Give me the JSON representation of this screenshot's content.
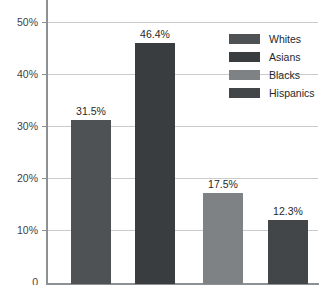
{
  "chart_data": {
    "type": "bar",
    "title": "",
    "subtitle": "",
    "xlabel": "",
    "ylabel": "",
    "categories": [
      "Whites",
      "Asians",
      "Blacks",
      "Hispanics"
    ],
    "values": [
      31.5,
      46.4,
      17.5,
      12.3
    ],
    "data_labels": [
      "31.5%",
      "46.4%",
      "17.5%",
      "12.3%"
    ],
    "ylim": [
      0,
      50
    ],
    "y_ticks": [
      50,
      40,
      30,
      20,
      10,
      0
    ],
    "y_tick_labels": [
      "50%",
      "40%",
      "30%",
      "20%",
      "10%",
      "0"
    ],
    "x_tick_labels": [
      "",
      "",
      "",
      ""
    ],
    "grid": true,
    "grid_axis": "y",
    "legend_position": "top-right",
    "legend": [
      {
        "label": "Whites",
        "color": "#4f5254"
      },
      {
        "label": "Asians",
        "color": "#3a3d3f"
      },
      {
        "label": "Blacks",
        "color": "#7f8285"
      },
      {
        "label": "Hispanics",
        "color": "#434648"
      }
    ],
    "series": [
      {
        "name": "Percentage",
        "points": [
          {
            "category": "Whites",
            "value": 31.5,
            "label": "31.5%",
            "color": "#4f5254"
          },
          {
            "category": "Asians",
            "value": 46.4,
            "label": "46.4%",
            "color": "#3a3d3f"
          },
          {
            "category": "Blacks",
            "value": 17.5,
            "label": "17.5%",
            "color": "#7f8285"
          },
          {
            "category": "Hispanics",
            "value": 12.3,
            "label": "12.3%",
            "color": "#434648"
          }
        ]
      }
    ]
  },
  "colors": {
    "background": "#ffffff",
    "axis": "#8e9194",
    "gridline": "#c9cbcd",
    "tick_label": "#3f4244",
    "data_label": "#26292b"
  }
}
